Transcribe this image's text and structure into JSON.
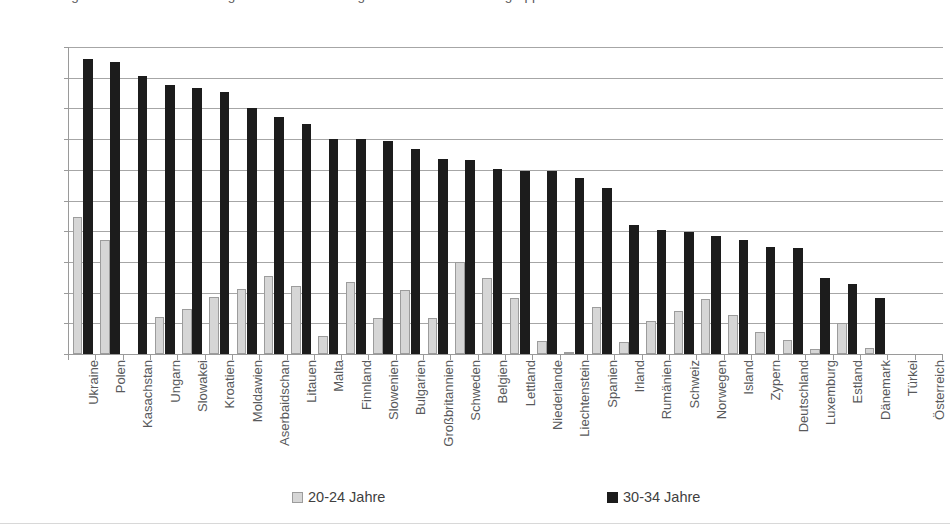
{
  "caption": {
    "top_cutoff_text": "Abbildung 3: Anteil der Bevölkerung mit tertiärem Bildungsabschluss nach Altersgruppen"
  },
  "legend": {
    "position": "bottom",
    "items": [
      {
        "label": "20-24 Jahre",
        "color": "#d6d6d6",
        "swatch": "light-square-swatch"
      },
      {
        "label": "30-34 Jahre",
        "color": "#1c1c1c",
        "swatch": "dark-square-swatch"
      }
    ]
  },
  "axis": {
    "y_ticks": [
      0,
      10,
      20,
      30,
      40,
      50,
      60,
      70,
      80,
      90,
      100
    ]
  },
  "chart_data": {
    "type": "bar",
    "title": "",
    "subtitle": "",
    "xlabel": "",
    "ylabel": "",
    "ylim": [
      0,
      100
    ],
    "ytick_step": 10,
    "grid": true,
    "legend_position": "bottom",
    "orientation": "vertical",
    "categories": [
      "Ukraine",
      "Polen",
      "Kasachstan",
      "Ungarn",
      "Slowakei",
      "Kroatien",
      "Moldawien",
      "Aserbaidschan",
      "Litauen",
      "Malta",
      "Finnland",
      "Slowenien",
      "Bulgarien",
      "Großbritannien",
      "Schweden",
      "Belgien",
      "Lettland",
      "Niederlande",
      "Liechtenstein",
      "Spanien",
      "Irland",
      "Rumänien",
      "Schweiz",
      "Norwegen",
      "Island",
      "Zypern",
      "Deutschland",
      "Luxemburg",
      "Estland",
      "Dänemark",
      "Türkei",
      "Österreich"
    ],
    "series": [
      {
        "name": "20-24 Jahre",
        "color": "#d6d6d6",
        "values": [
          44.5,
          37.3,
          0.0,
          12.0,
          14.7,
          18.5,
          21.2,
          25.5,
          22.3,
          6.0,
          23.4,
          11.7,
          21.0,
          11.8,
          30.1,
          24.6,
          18.2,
          4.2,
          0.6,
          15.4,
          3.8,
          10.6,
          14.0,
          18.0,
          12.8,
          7.1,
          4.6,
          1.6,
          10.0,
          2.1,
          0.0,
          0.0
        ]
      },
      {
        "name": "30-34 Jahre",
        "color": "#1c1c1c",
        "values": [
          96.0,
          95.0,
          90.4,
          87.6,
          86.8,
          85.2,
          80.0,
          77.3,
          74.9,
          70.2,
          70.1,
          69.3,
          66.8,
          63.6,
          63.1,
          60.4,
          59.6,
          59.5,
          57.3,
          54.1,
          42.0,
          40.4,
          39.6,
          38.4,
          37.2,
          34.8,
          34.5,
          24.8,
          22.8,
          18.2,
          0.0,
          0.0
        ]
      }
    ]
  }
}
